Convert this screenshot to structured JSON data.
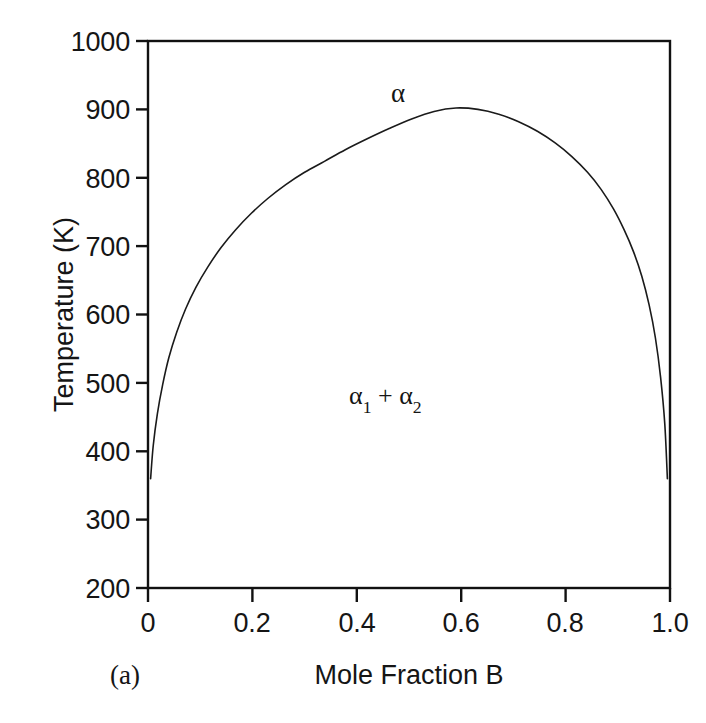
{
  "figure": {
    "panel_label": "(a)",
    "background_color": "#ffffff",
    "line_color": "#1a1a1a",
    "axis_color": "#111111"
  },
  "annotations": {
    "single_phase": "α",
    "two_phase_prefix": "α",
    "two_phase_sub1": "1",
    "two_phase_plus": " + ",
    "two_phase_sub2": "2"
  },
  "axes": {
    "y_title": "Temperature (K)",
    "x_title": "Mole Fraction B",
    "y_ticks": [
      "1000",
      "900",
      "800",
      "700",
      "600",
      "500",
      "400",
      "300",
      "200"
    ],
    "x_ticks": [
      "0",
      "0.2",
      "0.4",
      "0.6",
      "0.8",
      "1.0"
    ]
  },
  "chart_data": {
    "type": "line",
    "title": "",
    "subtitle": "",
    "panel": "(a)",
    "xlabel": "Mole Fraction B",
    "ylabel": "Temperature (K)",
    "xlim": [
      0.0,
      1.0
    ],
    "ylim": [
      200,
      1000
    ],
    "xticks": [
      0.0,
      0.2,
      0.4,
      0.6,
      0.8,
      1.0
    ],
    "xticklabels": [
      "0",
      "0.2",
      "0.4",
      "0.6",
      "0.8",
      "1.0"
    ],
    "yticks": [
      200,
      300,
      400,
      500,
      600,
      700,
      800,
      900,
      1000
    ],
    "yticklabels": [
      "200",
      "300",
      "400",
      "500",
      "600",
      "700",
      "800",
      "900",
      "1000"
    ],
    "grid": false,
    "legend": null,
    "frame": "box",
    "tick_direction": "out",
    "annotations": [
      {
        "text": "α",
        "x": 0.51,
        "y": 930,
        "note": "single-phase region label at dome apex"
      },
      {
        "text": "α₁ + β₂",
        "x": 0.5,
        "y": 485,
        "note": "two-phase region label inside miscibility gap"
      }
    ],
    "series": [
      {
        "name": "binodal (miscibility gap boundary)",
        "style": "solid",
        "color": "#1a1a1a",
        "width": 1.6,
        "x": [
          0.005,
          0.01,
          0.018,
          0.028,
          0.04,
          0.055,
          0.072,
          0.092,
          0.115,
          0.14,
          0.168,
          0.198,
          0.23,
          0.264,
          0.3,
          0.338,
          0.378,
          0.42,
          0.462,
          0.505,
          0.548,
          0.59,
          0.632,
          0.672,
          0.71,
          0.746,
          0.78,
          0.812,
          0.842,
          0.868,
          0.892,
          0.912,
          0.93,
          0.946,
          0.96,
          0.972,
          0.982,
          0.99,
          0.995
        ],
        "y": [
          360,
          408,
          455,
          497,
          537,
          574,
          608,
          640,
          670,
          698,
          724,
          748,
          770,
          790,
          808,
          824,
          841,
          857,
          872,
          886,
          897,
          902,
          900,
          893,
          882,
          868,
          851,
          831,
          808,
          783,
          754,
          724,
          692,
          656,
          614,
          566,
          508,
          440,
          360
        ]
      }
    ],
    "apex": {
      "x": 0.51,
      "y": 905,
      "label": "critical / consolute point"
    }
  }
}
